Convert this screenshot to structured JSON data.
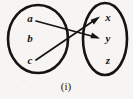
{
  "figure": {
    "caption": "(i)",
    "ink_color": "#16140f",
    "paper_color": "#f6f5f3"
  },
  "domain_set": {
    "name": "left-set",
    "shape": "ellipse",
    "elements": [
      {
        "label": "a",
        "cx": 30,
        "cy": 19
      },
      {
        "label": "b",
        "cy": 39,
        "cx": 30
      },
      {
        "label": "c",
        "cx": 30,
        "cy": 61
      }
    ],
    "ellipse": {
      "cx": 38,
      "cy": 39,
      "rx": 30,
      "ry": 34
    }
  },
  "codomain_set": {
    "name": "right-set",
    "shape": "ellipse",
    "elements": [
      {
        "label": "x",
        "cx": 108,
        "cy": 18
      },
      {
        "label": "y",
        "cx": 108,
        "cy": 39
      },
      {
        "label": "z",
        "cx": 108,
        "cy": 61
      }
    ],
    "ellipse": {
      "cx": 105,
      "cy": 39,
      "rx": 22,
      "ry": 36
    }
  },
  "mappings": [
    {
      "name": "arrow-a-to-y",
      "from": "a",
      "to": "y",
      "x1": 36,
      "y1": 21,
      "x2": 99,
      "y2": 38
    },
    {
      "name": "arrow-c-to-x",
      "from": "c",
      "to": "x",
      "x1": 36,
      "y1": 60,
      "x2": 99,
      "y2": 17
    }
  ]
}
